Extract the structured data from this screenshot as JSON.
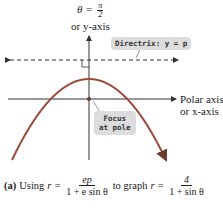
{
  "diagram": {
    "title_label": {
      "theta_eq": "θ =",
      "num": "π",
      "den": "2"
    },
    "y_axis_label": "or y-axis",
    "polar_axis_label": [
      "Polar axis",
      "or x-axis"
    ],
    "directrix_callout": "Directrix: y = p",
    "focus_callout": [
      "Focus",
      "at pole"
    ],
    "colors": {
      "parabola": "#9b4a3c",
      "callout_bg": "#dcdcdc",
      "axis": "#333333"
    }
  },
  "caption": {
    "part": "(a)",
    "using": "Using",
    "r_eq": "r =",
    "gen_num": "ep",
    "gen_den": "1 + e sin θ",
    "to_graph": "to graph",
    "r_eq2": "r =",
    "spec_num": "4",
    "spec_den": "1 + sin θ"
  }
}
